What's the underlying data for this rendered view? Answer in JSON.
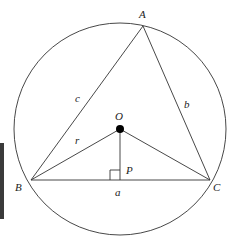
{
  "diagram": {
    "stroke_color": "#333333",
    "side_bar_color": "#3a3a3a",
    "circle": {
      "cx": 120,
      "cy": 129,
      "r": 106
    },
    "center": {
      "label": "O",
      "x": 120,
      "y": 129
    },
    "vertices": [
      {
        "label": "A",
        "x": 143,
        "y": 26
      },
      {
        "label": "B",
        "x": 31,
        "y": 180
      },
      {
        "label": "C",
        "x": 210,
        "y": 180
      }
    ],
    "foot": {
      "label": "P",
      "x": 120,
      "y": 180
    },
    "side_labels": {
      "a": "a",
      "b": "b",
      "c": "c",
      "r": "r"
    }
  }
}
